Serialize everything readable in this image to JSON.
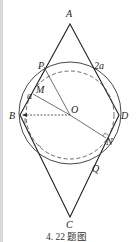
{
  "figure": {
    "caption": "4. 22 题图",
    "points": {
      "A": {
        "label": "A"
      },
      "B": {
        "label": "B"
      },
      "C": {
        "label": "C"
      },
      "D": {
        "label": "D"
      },
      "O": {
        "label": "O"
      },
      "P": {
        "label": "P"
      },
      "M": {
        "label": "M"
      },
      "N": {
        "label": "N"
      },
      "Q": {
        "label": "Q"
      }
    },
    "annotations": {
      "side_short": "a",
      "side_long": "2a"
    },
    "colors": {
      "stroke": "#222222",
      "background": "#ffffff"
    }
  }
}
